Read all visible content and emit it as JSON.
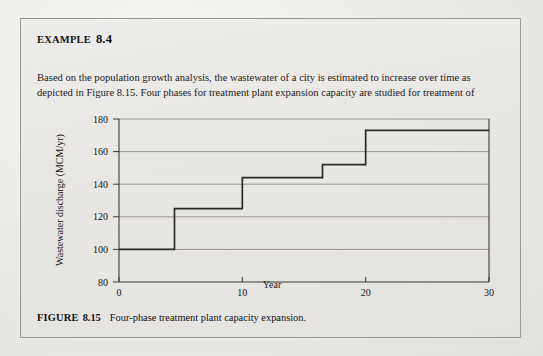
{
  "document": {
    "example_heading": {
      "label": "Example",
      "number": "8.4"
    },
    "body_text": "Based on the population growth analysis, the wastewater of a city is estimated to increase over time as depicted in Figure 8.15. Four phases for treatment plant expansion capacity are studied for treatment of",
    "caption": {
      "label": "FIGURE",
      "number": "8.15",
      "text": "Four-phase treatment plant capacity expansion."
    }
  },
  "chart_data": {
    "type": "line",
    "subtype": "step",
    "title": "",
    "xlabel": "Year",
    "ylabel": "Wastewater discharge (MCM/yr)",
    "xlim": [
      0,
      30
    ],
    "ylim": [
      80,
      180
    ],
    "xticks": [
      0,
      10,
      20,
      30
    ],
    "xtick_labels": [
      "0",
      "10",
      "20",
      "30"
    ],
    "yticks": [
      80,
      100,
      120,
      140,
      160,
      180
    ],
    "ytick_labels": [
      "80",
      "100",
      "120",
      "140",
      "160",
      "180"
    ],
    "grid": "horizontal",
    "legend": "none",
    "series": [
      {
        "name": "Treatment plant capacity",
        "steps": [
          {
            "x_start": 0,
            "x_end": 4.5,
            "y": 100
          },
          {
            "x_start": 4.5,
            "x_end": 10,
            "y": 125
          },
          {
            "x_start": 10,
            "x_end": 16.5,
            "y": 144
          },
          {
            "x_start": 16.5,
            "x_end": 20,
            "y": 152
          },
          {
            "x_start": 20,
            "x_end": 30,
            "y": 173
          }
        ]
      }
    ],
    "phase_count": 4
  },
  "style": {
    "line_color": "#2a2a2a",
    "grid_color": "#8d8b87",
    "axis_color": "#3a3a3a",
    "paper_color": "#eae8e5"
  }
}
